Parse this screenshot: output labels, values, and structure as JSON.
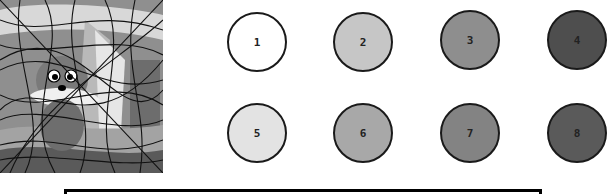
{
  "game": {
    "type": "color-by-number",
    "picture": {
      "subject": "cartoon creature (cat/mouse) with big eyes in front of a house, overlaid with tangled lines"
    },
    "palette": [
      {
        "number": "1",
        "color": "#ffffff"
      },
      {
        "number": "2",
        "color": "#c6c6c6"
      },
      {
        "number": "3",
        "color": "#8e8e8e"
      },
      {
        "number": "4",
        "color": "#4e4e4e"
      },
      {
        "number": "5",
        "color": "#e3e3e3"
      },
      {
        "number": "6",
        "color": "#a8a8a8"
      },
      {
        "number": "7",
        "color": "#838383"
      },
      {
        "number": "8",
        "color": "#5a5a5a"
      }
    ],
    "caption": ""
  }
}
